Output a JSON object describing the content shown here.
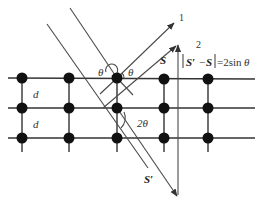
{
  "diagram": {
    "labels": {
      "ray1": "1",
      "ray2": "2",
      "incident_angle_left": "θ",
      "reflected_angle_right": "θ",
      "scatter_angle": "2θ",
      "spacing_top": "d",
      "spacing_bottom": "d",
      "vec_s": "S",
      "vec_s_prime": "S′",
      "equation_vec_a": "S′",
      "equation_minus": "−",
      "equation_vec_b": "S",
      "equation_rhs": "=2sin",
      "equation_theta": "θ"
    },
    "lattice": {
      "rows": 3,
      "columns": 5,
      "atom_color": "#111111",
      "line_color": "#333333"
    }
  }
}
